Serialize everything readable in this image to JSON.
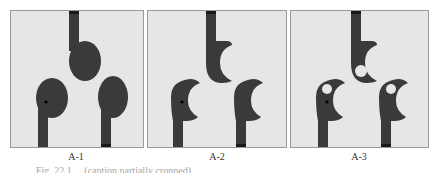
{
  "figure": {
    "panels": [
      {
        "id": "A-1",
        "label": "A-1",
        "variant": "elliptical patches"
      },
      {
        "id": "A-2",
        "label": "A-2",
        "variant": "crescent-cut patches"
      },
      {
        "id": "A-3",
        "label": "A-3",
        "variant": "crescent-cut patches with circular slots"
      }
    ],
    "caption": "Fig. 22.1 ... (caption partially cropped)"
  },
  "colors": {
    "background": "#e6e6e6",
    "conductor": "#3a3a3a",
    "border": "#9a9a9a",
    "slot": "#e6e6e6"
  }
}
